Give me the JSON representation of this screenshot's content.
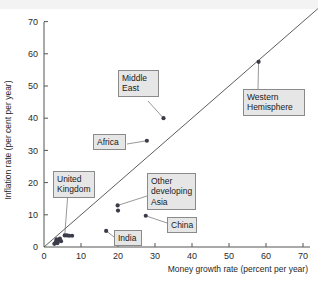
{
  "chart_data": {
    "type": "scatter",
    "title": "",
    "xlabel": "Money growth rate (percent per year)",
    "ylabel": "Inflation rate (per cent per year)",
    "xlim": [
      0,
      75
    ],
    "ylim": [
      0,
      75
    ],
    "xticks": [
      0,
      10,
      20,
      30,
      40,
      50,
      60,
      70
    ],
    "yticks": [
      0,
      10,
      20,
      30,
      40,
      50,
      60,
      70
    ],
    "grid": false,
    "legend": "none",
    "reference_line": {
      "label": "45-degree line",
      "from": [
        0,
        0
      ],
      "to": [
        74,
        74
      ]
    },
    "points": [
      {
        "label": "",
        "x": 2.8,
        "y": 1.0
      },
      {
        "label": "",
        "x": 3.2,
        "y": 1.6
      },
      {
        "label": "",
        "x": 3.4,
        "y": 2.4
      },
      {
        "label": "",
        "x": 3.6,
        "y": 1.2
      },
      {
        "label": "",
        "x": 4.0,
        "y": 2.0
      },
      {
        "label": "",
        "x": 4.3,
        "y": 2.6
      },
      {
        "label": "",
        "x": 4.6,
        "y": 1.8
      },
      {
        "label": "United Kingdom",
        "x": 5.6,
        "y": 3.6
      },
      {
        "label": "",
        "x": 6.2,
        "y": 3.6
      },
      {
        "label": "",
        "x": 6.8,
        "y": 3.5
      },
      {
        "label": "",
        "x": 7.6,
        "y": 3.5
      },
      {
        "label": "India",
        "x": 16.8,
        "y": 5.0
      },
      {
        "label": "Other developing Asia",
        "x": 19.9,
        "y": 12.9
      },
      {
        "label": "",
        "x": 20.0,
        "y": 11.3
      },
      {
        "label": "China",
        "x": 27.5,
        "y": 9.7
      },
      {
        "label": "Africa",
        "x": 27.8,
        "y": 33.0
      },
      {
        "label": "Middle East",
        "x": 32.3,
        "y": 40.0
      },
      {
        "label": "Western Hemisphere",
        "x": 58.0,
        "y": 57.5
      }
    ],
    "annotations": [
      {
        "name": "middle-east",
        "text": "Middle\nEast"
      },
      {
        "name": "western-hemisphere",
        "text": "Western\nHemisphere"
      },
      {
        "name": "africa",
        "text": "Africa"
      },
      {
        "name": "united-kingdom",
        "text": "United\nKingdom"
      },
      {
        "name": "other-developing-asia",
        "text": "Other\ndeveloping\nAsia"
      },
      {
        "name": "china",
        "text": "China"
      },
      {
        "name": "india",
        "text": "India"
      }
    ]
  },
  "axes": {
    "x_title": "Money growth rate (percent per year)",
    "y_title": "Inflation rate (per cent per year)",
    "x_tick_labels": [
      "0",
      "10",
      "20",
      "30",
      "40",
      "50",
      "60",
      "70"
    ],
    "y_tick_labels": [
      "0",
      "10",
      "20",
      "30",
      "40",
      "50",
      "60",
      "70"
    ]
  },
  "colors": {
    "point": "#3b3b4a",
    "line": "#4a4a4a",
    "callout_bg": "#e6e6e6",
    "callout_border": "#8a8a8a",
    "axis": "#555555"
  },
  "callouts": {
    "middle_east": "Middle\nEast",
    "western_hemisphere": "Western\nHemisphere",
    "africa": "Africa",
    "united_kingdom": "United\nKingdom",
    "other_developing_asia": "Other\ndeveloping\nAsia",
    "china": "China",
    "india": "India"
  }
}
